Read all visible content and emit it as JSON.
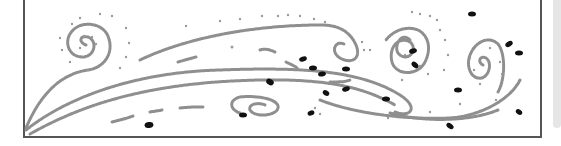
{
  "illustration": {
    "name": "wind-swirl-drawing",
    "description": "Stippled line drawing of wind currents with spirals, dotted particles and dark seeds",
    "colors": {
      "stroke": "#8a8a8a",
      "dots": "#9a9a9a",
      "seeds": "#111111",
      "frame": "#555555",
      "background": "#ffffff"
    }
  }
}
